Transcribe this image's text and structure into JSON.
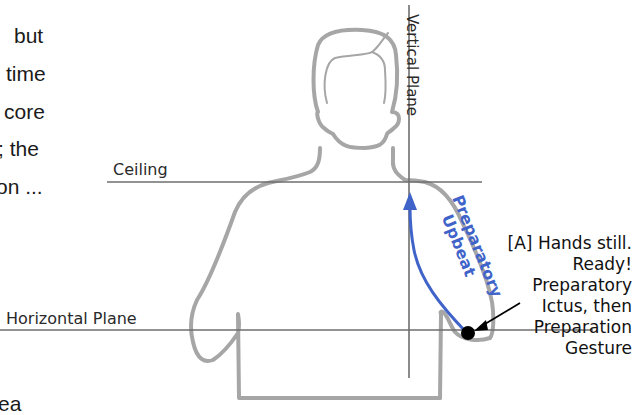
{
  "left_text_fragments": [
    "but",
    "time",
    "core",
    "; the",
    "on ...",
    "ea"
  ],
  "labels": {
    "vertical_plane": "Vertical Plane",
    "ceiling": "Ceiling",
    "horizontal_plane": "Horizontal Plane",
    "upbeat_line1": "Preparatory",
    "upbeat_line2": "Upbeat"
  },
  "annotation": {
    "lines": [
      "[A] Hands still.",
      "Ready!",
      "Preparatory",
      "Ictus, then",
      "Preparation",
      "Gesture"
    ]
  },
  "colors": {
    "outline": "#a6a6a6",
    "plane_lines": "#6e6e6e",
    "upbeat_blue": "#3f63c9",
    "dot": "#000000"
  }
}
